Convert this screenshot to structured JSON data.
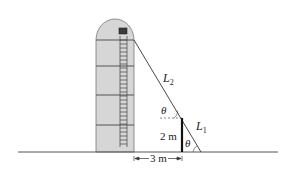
{
  "diagram": {
    "labels": {
      "L2": "L",
      "L2_sub": "2",
      "L1": "L",
      "L1_sub": "1",
      "theta_top": "θ",
      "theta_bottom": "θ",
      "post_height": "2 m",
      "distance": "3 m"
    },
    "colors": {
      "silo_fill": "#d6d6d6",
      "silo_stroke": "#555555",
      "line": "#333333",
      "post": "#111111",
      "window": "#3a3a3a"
    }
  }
}
